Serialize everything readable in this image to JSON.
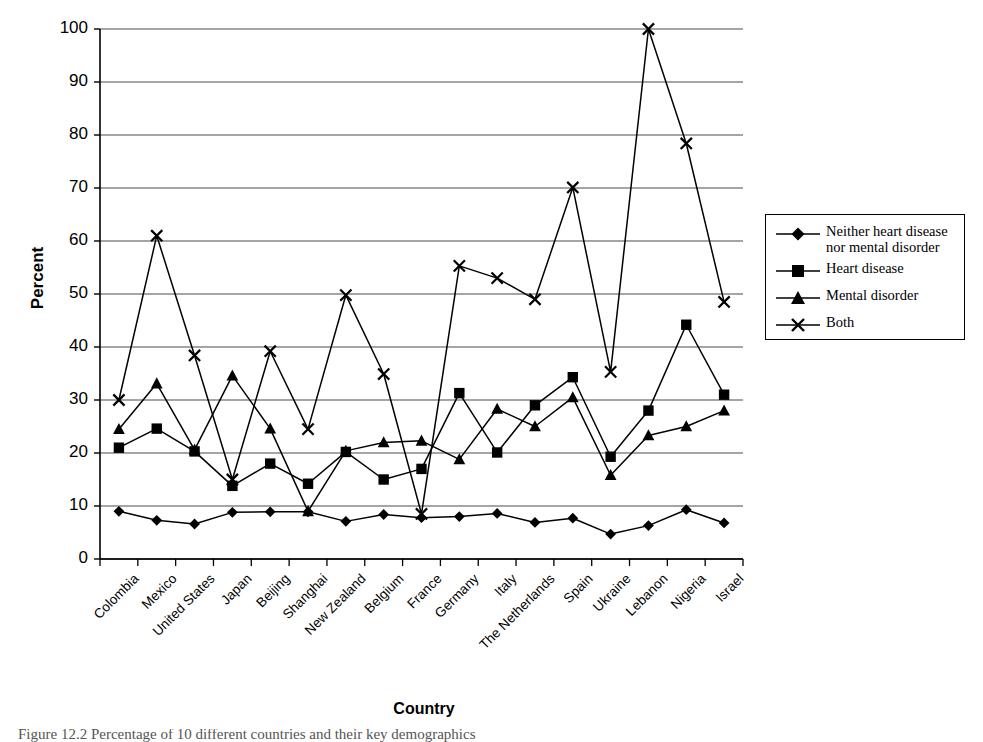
{
  "chart_data": {
    "type": "line",
    "title": "",
    "xlabel": "Country",
    "ylabel": "Percent",
    "ylim": [
      0,
      100
    ],
    "ytick_values": [
      0,
      10,
      20,
      30,
      40,
      50,
      60,
      70,
      80,
      90,
      100
    ],
    "ytick_labels": [
      "0",
      "10",
      "20",
      "30",
      "40",
      "50",
      "60",
      "70",
      "80",
      "90",
      "100"
    ],
    "grid": "horizontal",
    "legend_position": "right",
    "categories": [
      "Colombia",
      "Mexico",
      "United States",
      "Japan",
      "Beijing",
      "Shanghai",
      "New Zealand",
      "Belgium",
      "France",
      "Germany",
      "Italy",
      "The Netherlands",
      "Spain",
      "Ukraine",
      "Lebanon",
      "Nigeria",
      "Israel"
    ],
    "series": [
      {
        "name": "Neither heart disease nor mental disorder",
        "marker": "diamond",
        "values": [
          9.0,
          7.3,
          6.6,
          8.8,
          8.9,
          8.9,
          7.1,
          8.4,
          7.8,
          8.0,
          8.6,
          6.9,
          7.7,
          4.7,
          6.3,
          9.3,
          6.8
        ]
      },
      {
        "name": "Heart disease",
        "marker": "square",
        "values": [
          21.0,
          24.6,
          20.3,
          13.8,
          18.0,
          14.2,
          20.2,
          15.0,
          17.0,
          31.3,
          20.1,
          29.0,
          34.3,
          19.3,
          28.0,
          44.2,
          31.0
        ]
      },
      {
        "name": "Mental disorder",
        "marker": "triangle",
        "values": [
          24.5,
          33.1,
          20.6,
          34.6,
          24.6,
          9.0,
          20.4,
          22.0,
          22.3,
          18.8,
          28.3,
          25.0,
          30.5,
          15.8,
          23.3,
          25.0,
          28.0
        ]
      },
      {
        "name": "Both",
        "marker": "cross",
        "values": [
          30.0,
          61.0,
          38.4,
          15.0,
          39.2,
          24.5,
          49.8,
          34.9,
          8.5,
          55.3,
          53.0,
          49.0,
          70.1,
          35.3,
          100.0,
          78.4,
          48.5
        ]
      }
    ]
  },
  "legend": {
    "entries": [
      {
        "label_line1": "Neither heart disease",
        "label_line2": "nor mental disorder"
      },
      {
        "label_line1": "Heart disease",
        "label_line2": ""
      },
      {
        "label_line1": "Mental disorder",
        "label_line2": ""
      },
      {
        "label_line1": "Both",
        "label_line2": ""
      }
    ]
  },
  "caption": {
    "text": "Figure 12.2  Percentage of 10 different countries and their key demographics"
  },
  "colors": {
    "line": "#000000",
    "grid": "#4d4d4d",
    "axis": "#000000",
    "background": "#ffffff"
  }
}
